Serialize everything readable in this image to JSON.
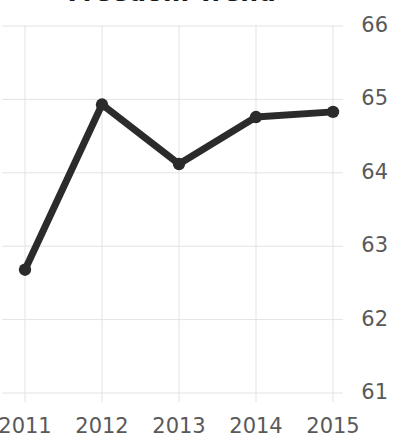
{
  "chart_data": {
    "type": "line",
    "title": "Freedom Trend",
    "xlabel": "",
    "ylabel": "",
    "categories": [
      "2011",
      "2012",
      "2013",
      "2014",
      "2015"
    ],
    "x": [
      2011,
      2012,
      2013,
      2014,
      2015
    ],
    "values": [
      62.68,
      64.93,
      64.12,
      64.76,
      64.83
    ],
    "series": [
      {
        "name": "Freedom Trend",
        "values": [
          62.68,
          64.93,
          64.12,
          64.76,
          64.83
        ]
      }
    ],
    "ylim": [
      60.55,
      66.35
    ],
    "yticks": [
      61,
      62,
      63,
      64,
      65,
      66
    ],
    "ytick_labels": [
      "61",
      "62",
      "63",
      "64",
      "65",
      "66"
    ],
    "xticks": [
      2011,
      2012,
      2013,
      2014,
      2015
    ],
    "xtick_labels": [
      "2011",
      "2012",
      "2013",
      "2014",
      "2015"
    ],
    "y_axis_position": "right",
    "grid": true,
    "grid_axes": "both",
    "legend": false,
    "legend_position": "none",
    "marker": "circle",
    "line_color": "#2b2b2b",
    "marker_color": "#2b2b2b",
    "grid_color": "#e3e3e6",
    "tick_label_color": "#595959",
    "title_color": "#1a1a1a",
    "background_color": "#ffffff",
    "annotations": []
  },
  "axes": {
    "y_ticks": [
      {
        "label": "66",
        "value": 66
      },
      {
        "label": "65",
        "value": 65
      },
      {
        "label": "64",
        "value": 64
      },
      {
        "label": "63",
        "value": 63
      },
      {
        "label": "62",
        "value": 62
      },
      {
        "label": "61",
        "value": 61
      }
    ],
    "x_ticks": [
      {
        "label": "2011",
        "value": 2011
      },
      {
        "label": "2012",
        "value": 2012
      },
      {
        "label": "2013",
        "value": 2013
      },
      {
        "label": "2014",
        "value": 2014
      },
      {
        "label": "2015",
        "value": 2015
      }
    ]
  }
}
